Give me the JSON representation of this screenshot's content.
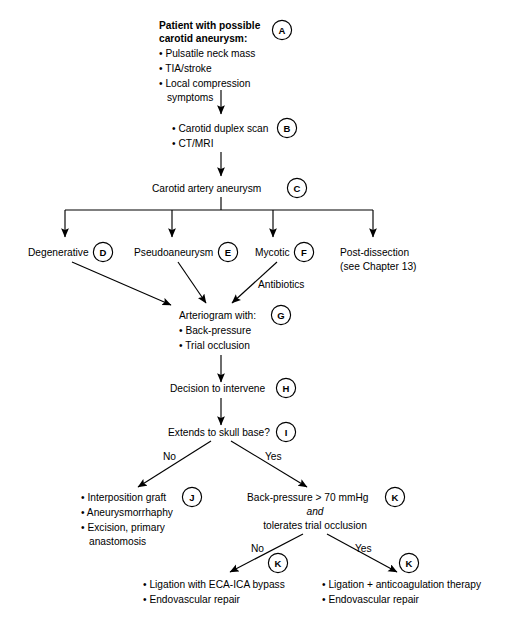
{
  "diagram": {
    "background_color": "#ffffff",
    "line_color": "#000000",
    "text_color": "#000000"
  },
  "nodes": {
    "a": {
      "tag": "A",
      "line1": "Patient with possible",
      "line2": "carotid aneurysm:",
      "bullet1": "• Pulsatile neck mass",
      "bullet2": "• TIA/stroke",
      "bullet3": "• Local compression",
      "bullet3_cont": "symptoms"
    },
    "b": {
      "tag": "B",
      "bullet1": "• Carotid duplex scan",
      "bullet2": "• CT/MRI"
    },
    "c": {
      "tag": "C",
      "label": "Carotid artery aneurysm"
    },
    "d": {
      "tag": "D",
      "label": "Degenerative"
    },
    "e": {
      "tag": "E",
      "label": "Pseudoaneurysm"
    },
    "f": {
      "tag": "F",
      "label": "Mycotic"
    },
    "post_dissection": {
      "line1": "Post-dissection",
      "line2": "(see Chapter 13)"
    },
    "g": {
      "tag": "G",
      "label": "Arteriogram with:",
      "bullet1": "• Back-pressure",
      "bullet2": "• Trial occlusion"
    },
    "h": {
      "tag": "H",
      "label": "Decision to intervene"
    },
    "i": {
      "tag": "I",
      "label": "Extends to skull base?"
    },
    "j": {
      "tag": "J",
      "bullet1": "• Interposition graft",
      "bullet2": "• Aneurysmorrhaphy",
      "bullet3": "• Excision, primary",
      "bullet3_cont": "anastomosis"
    },
    "k_top": {
      "tag": "K",
      "line1": "Back-pressure > 70 mmHg",
      "line2": "and",
      "line3": "tolerates trial occlusion"
    },
    "k_left": {
      "tag": "K",
      "bullet1": "• Ligation with ECA-ICA bypass",
      "bullet2": "• Endovascular repair"
    },
    "k_right": {
      "tag": "K",
      "bullet1": "• Ligation + anticoagulation therapy",
      "bullet2": "• Endovascular repair"
    }
  },
  "edge_labels": {
    "antibiotics": "Antibiotics",
    "skull_base_no": "No",
    "skull_base_yes": "Yes",
    "backpressure_no": "No",
    "backpressure_yes": "Yes"
  }
}
